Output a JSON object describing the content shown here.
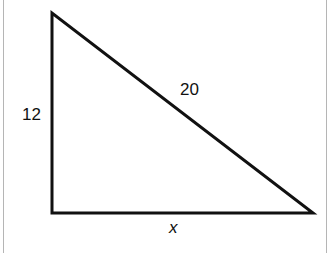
{
  "diagram": {
    "type": "right-triangle",
    "vertices": {
      "top": [
        52,
        13
      ],
      "bottom_left": [
        52,
        213
      ],
      "bottom_right": [
        313,
        213
      ]
    },
    "stroke_color": "#111111",
    "labels": {
      "vertical_leg": "12",
      "hypotenuse": "20",
      "horizontal_leg": "x"
    }
  }
}
